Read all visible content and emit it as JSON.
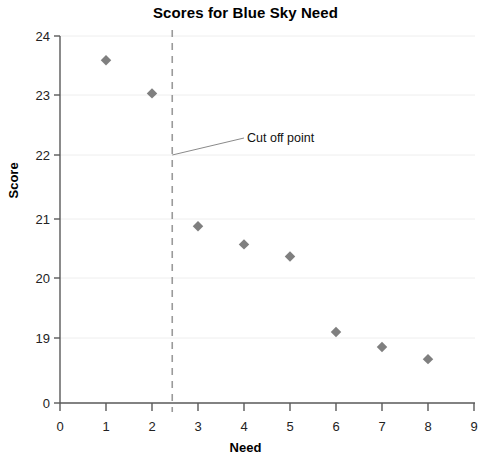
{
  "chart_data": {
    "type": "scatter",
    "title": "Scores for Blue Sky Need",
    "xlabel": "Need",
    "ylabel": "Score",
    "x": [
      1,
      2,
      3,
      4,
      5,
      6,
      7,
      8
    ],
    "values": [
      23.6,
      23.05,
      20.85,
      20.55,
      20.35,
      19.1,
      18.85,
      18.65
    ],
    "points": [
      {
        "x": 1,
        "y": 23.6
      },
      {
        "x": 2,
        "y": 23.05
      },
      {
        "x": 3,
        "y": 20.85
      },
      {
        "x": 4,
        "y": 20.55
      },
      {
        "x": 5,
        "y": 20.35
      },
      {
        "x": 6,
        "y": 19.1
      },
      {
        "x": 7,
        "y": 18.85
      },
      {
        "x": 8,
        "y": 18.65
      }
    ],
    "xlim": [
      0,
      9
    ],
    "ylim": [
      18.35,
      24
    ],
    "x_ticks": [
      "0",
      "1",
      "2",
      "3",
      "4",
      "5",
      "6",
      "7",
      "8",
      "9"
    ],
    "y_ticks": [
      "24",
      "23",
      "22",
      "21",
      "20",
      "19",
      "0"
    ],
    "y_axis_break": true,
    "grid": "horizontal",
    "legend": "none",
    "marker": "diamond",
    "marker_color": "#7f7f7f",
    "grid_color": "#eeeeee",
    "axis_color": "#595959",
    "annotations": [
      {
        "text": "Cut off point",
        "kind": "cut-off-line",
        "x_value": 2.44,
        "line_style": "dashed",
        "line_color": "#9a9a9a"
      }
    ]
  },
  "annotation": {
    "cut_off_label": "Cut off point"
  }
}
